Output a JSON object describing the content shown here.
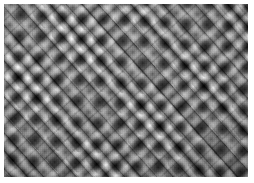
{
  "image": {
    "title": "Woven textile macro",
    "subject": "woven fabric swatch",
    "capture": "macro photograph",
    "color_mode": "grayscale",
    "weave_type": "twill / herringbone basket weave",
    "alt_text": "Close-up grayscale photograph of a woven fabric showing diagonal twill ribs crossing in alternating blocks with dark pores at the yarn intersections"
  },
  "canvas": {
    "width_px": 254,
    "height_px": 183,
    "background_color": "#ffffff"
  },
  "swatch": {
    "left_px": 4,
    "top_px": 4,
    "width_px": 244,
    "height_px": 173,
    "margin_color": "#ffffff"
  },
  "weave": {
    "primary_rib_angle_deg": 48,
    "secondary_rib_angle_deg": -42,
    "rib_period_px": 12,
    "block_period_px": 26,
    "pore_spacing_px": 18.5,
    "pore_rotation_deg": 3
  },
  "palette": {
    "highlight": "#f2f2f2",
    "midtone": "#c2c2c2",
    "shadow": "#565656",
    "pore_dark": "#101010",
    "paper_white": "#ffffff"
  }
}
